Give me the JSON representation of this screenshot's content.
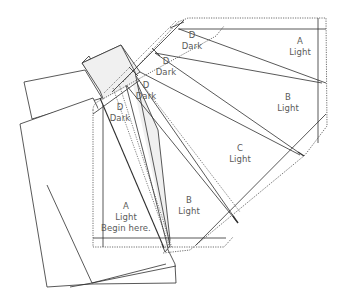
{
  "diagram": {
    "colors": {
      "line": "#2f2f2f",
      "dotted": "#4a4a4a",
      "shade": "#f0f0f0",
      "text": "#5a5a5a"
    },
    "labels": [
      {
        "id": "hex-d1",
        "letter": "D",
        "fabric": "Dark",
        "x": 192,
        "y": 30
      },
      {
        "id": "hex-a",
        "letter": "A",
        "fabric": "Light",
        "x": 300,
        "y": 40
      },
      {
        "id": "hex-d2",
        "letter": "D",
        "fabric": "Dark",
        "x": 166,
        "y": 58
      },
      {
        "id": "hex-d3",
        "letter": "D",
        "fabric": "Dark",
        "x": 145,
        "y": 80
      },
      {
        "id": "hex-b",
        "letter": "B",
        "fabric": "Light",
        "x": 289,
        "y": 96
      },
      {
        "id": "strip-d",
        "letter": "D",
        "fabric": "Dark",
        "x": 120,
        "y": 104
      },
      {
        "id": "hex-c",
        "letter": "C",
        "fabric": "Light",
        "x": 240,
        "y": 147
      },
      {
        "id": "strip-b",
        "letter": "B",
        "fabric": "Light",
        "x": 189,
        "y": 200
      },
      {
        "id": "strip-a",
        "letter": "A",
        "fabric": "Light",
        "note": "Begin here.",
        "x": 126,
        "y": 205
      }
    ],
    "shaded_paper": [
      [
        82,
        63
      ],
      [
        121,
        45
      ],
      [
        137,
        65
      ],
      [
        140,
        72
      ],
      [
        100,
        90
      ]
    ],
    "paper_sheets": [
      [
        [
          24,
          90
        ],
        [
          85,
          75
        ],
        [
          101,
          98
        ],
        [
          31,
          118
        ]
      ],
      [
        [
          20,
          128
        ],
        [
          93,
          98
        ],
        [
          176,
          283
        ],
        [
          70,
          287
        ]
      ],
      [
        [
          47,
          286
        ],
        [
          92,
          283
        ],
        [
          166,
          265
        ],
        [
          175,
          280
        ],
        [
          92,
          284
        ]
      ]
    ]
  }
}
